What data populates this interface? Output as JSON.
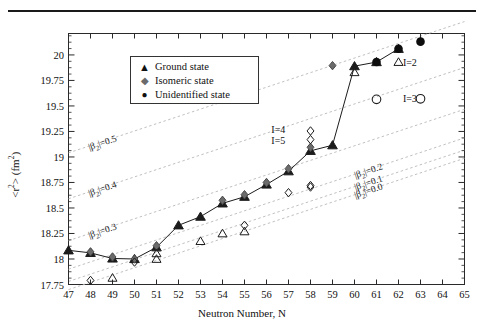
{
  "chart_data": {
    "type": "scatter",
    "title": "",
    "xlabel": "Neutron Number, N",
    "ylabel": "<r²> (fm²)",
    "xlim": [
      47,
      65
    ],
    "ylim": [
      17.75,
      20.21
    ],
    "xticks": [
      47,
      48,
      49,
      50,
      51,
      52,
      53,
      54,
      55,
      56,
      57,
      58,
      59,
      60,
      61,
      62,
      63,
      64,
      65
    ],
    "yticks": [
      17.75,
      18,
      18.25,
      18.5,
      18.75,
      19,
      19.25,
      19.5,
      19.75,
      20
    ],
    "grid": false,
    "legend_position": "upper-left-inset",
    "series": [
      {
        "name": "Ground state",
        "marker": "filled-triangle",
        "color": "#1c1c1c",
        "connected": true,
        "points": [
          {
            "x": 47,
            "y": 18.085
          },
          {
            "x": 48,
            "y": 18.06
          },
          {
            "x": 49,
            "y": 18.005
          },
          {
            "x": 50,
            "y": 18.0
          },
          {
            "x": 51,
            "y": 18.115
          },
          {
            "x": 52,
            "y": 18.33
          },
          {
            "x": 53,
            "y": 18.415
          },
          {
            "x": 54,
            "y": 18.545
          },
          {
            "x": 55,
            "y": 18.61
          },
          {
            "x": 56,
            "y": 18.73
          },
          {
            "x": 57,
            "y": 18.86
          },
          {
            "x": 58,
            "y": 19.06
          },
          {
            "x": 59,
            "y": 19.115
          },
          {
            "x": 60,
            "y": 19.89
          },
          {
            "x": 61,
            "y": 19.93
          },
          {
            "x": 62,
            "y": 20.06
          }
        ]
      },
      {
        "name": "Isomeric state",
        "marker": "filled-diamond",
        "color": "#6b6b6b",
        "connected": false,
        "points": [
          {
            "x": 48,
            "y": 18.07
          },
          {
            "x": 49,
            "y": 18.02
          },
          {
            "x": 50,
            "y": 18.0
          },
          {
            "x": 51,
            "y": 18.13
          },
          {
            "x": 54,
            "y": 18.575
          },
          {
            "x": 55,
            "y": 18.63
          },
          {
            "x": 56,
            "y": 18.75
          },
          {
            "x": 57,
            "y": 18.885
          },
          {
            "x": 58,
            "y": 19.095
          },
          {
            "x": 59,
            "y": 19.895
          }
        ]
      },
      {
        "name": "Unidentified state",
        "marker": "filled-circle",
        "color": "#0d0d0d",
        "connected": false,
        "points": [
          {
            "x": 61,
            "y": 19.93
          },
          {
            "x": 62,
            "y": 20.06
          },
          {
            "x": 63,
            "y": 20.13
          }
        ]
      },
      {
        "name": "open-triangle",
        "marker": "open-triangle",
        "color": "#1c1c1c",
        "connected": false,
        "points": [
          {
            "x": 49,
            "y": 17.815
          },
          {
            "x": 51,
            "y": 18.0
          },
          {
            "x": 51,
            "y": 18.055
          },
          {
            "x": 53,
            "y": 18.175
          },
          {
            "x": 54,
            "y": 18.25
          },
          {
            "x": 55,
            "y": 18.27
          },
          {
            "x": 60,
            "y": 19.83
          },
          {
            "x": 62,
            "y": 19.93
          }
        ]
      },
      {
        "name": "open-diamond",
        "marker": "open-diamond",
        "color": "#1c1c1c",
        "connected": false,
        "points": [
          {
            "x": 48,
            "y": 17.79
          },
          {
            "x": 50,
            "y": 17.97
          },
          {
            "x": 55,
            "y": 18.33
          },
          {
            "x": 57,
            "y": 18.65
          },
          {
            "x": 58,
            "y": 18.705
          },
          {
            "x": 58,
            "y": 18.72
          },
          {
            "x": 58,
            "y": 19.255
          },
          {
            "x": 58,
            "y": 19.17
          }
        ]
      },
      {
        "name": "open-circle",
        "marker": "open-circle",
        "color": "#1c1c1c",
        "connected": false,
        "points": [
          {
            "x": 61,
            "y": 19.565
          },
          {
            "x": 63,
            "y": 19.57
          }
        ]
      }
    ],
    "reference_lines": [
      {
        "label": "|β₂|=0.5",
        "intercept_at_47": 19.04,
        "slope": 0.0715
      },
      {
        "label": "|β₂|=0.4",
        "intercept_at_47": 18.59,
        "slope": 0.0715
      },
      {
        "label": "|β₂|=0.3",
        "intercept_at_47": 18.18,
        "slope": 0.0715
      },
      {
        "label": "|β₂|=0.2",
        "intercept_at_47": 17.9,
        "slope": 0.0715
      },
      {
        "label": "|β₂|=0.1",
        "intercept_at_47": 17.78,
        "slope": 0.0715
      },
      {
        "label": "|β₂|=0.0",
        "intercept_at_47": 17.7,
        "slope": 0.0715
      }
    ],
    "annotations": [
      {
        "text": "I=2",
        "x": 62.2,
        "y": 19.925
      },
      {
        "text": "I=3",
        "x": 62.2,
        "y": 19.565
      },
      {
        "text": "I=4",
        "x": 57.4,
        "y": 19.26
      },
      {
        "text": "I=5",
        "x": 57.4,
        "y": 19.16
      }
    ]
  },
  "axes": {
    "x_title": "Neutron Number, N",
    "y_title_prefix": "<r",
    "y_title_sup": "2",
    "y_title_suffix": "> (fm",
    "y_title_sup2": "2",
    "y_title_end": ")",
    "xtick_labels": [
      "47",
      "48",
      "49",
      "50",
      "51",
      "52",
      "53",
      "54",
      "55",
      "56",
      "57",
      "58",
      "59",
      "60",
      "61",
      "62",
      "63",
      "64",
      "65"
    ],
    "ytick_labels": [
      "17.75",
      "18",
      "18.25",
      "18.5",
      "18.75",
      "19",
      "19.25",
      "19.5",
      "19.75",
      "20"
    ]
  },
  "legend": {
    "items": [
      {
        "glyph": "▲",
        "label": "Ground state",
        "icon": "filled-triangle-icon",
        "color": "#1c1c1c"
      },
      {
        "glyph": "◆",
        "label": "Isomeric state",
        "icon": "filled-diamond-icon",
        "color": "#6b6b6b"
      },
      {
        "glyph": "●",
        "label": "Unidentified state",
        "icon": "filled-circle-icon",
        "color": "#0d0d0d"
      }
    ]
  },
  "beta_labels": [
    {
      "text": "|β₂|=0.5"
    },
    {
      "text": "|β₂|=0.4"
    },
    {
      "text": "|β₂|=0.3"
    },
    {
      "text": "|β₂|=0.2"
    },
    {
      "text": "|β₂|=0.1"
    },
    {
      "text": "|β₂|=0.0"
    }
  ],
  "i_labels": [
    {
      "text": "I=2"
    },
    {
      "text": "I=3"
    },
    {
      "text": "I=4"
    },
    {
      "text": "I=5"
    }
  ]
}
